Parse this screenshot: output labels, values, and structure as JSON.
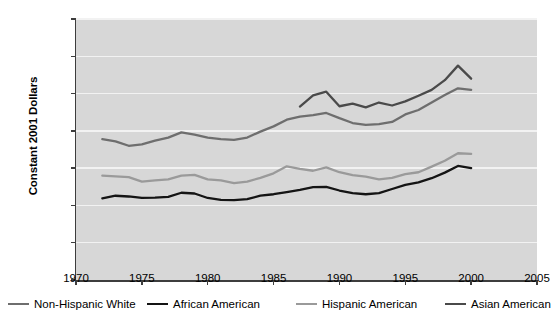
{
  "chart_data": {
    "type": "line",
    "title": "",
    "subtitle": "",
    "xlabel": "",
    "ylabel": "Constant 2001 Dollars",
    "xlim": [
      1970,
      2005
    ],
    "ylim": [
      0,
      70000
    ],
    "grid": true,
    "legend_position": "bottom",
    "y_ticks": [
      0,
      10000,
      20000,
      30000,
      40000,
      50000,
      60000,
      70000
    ],
    "y_tick_labels": [
      "0",
      "10,000",
      "20,000",
      "30,000",
      "40,000",
      "50,000",
      "60,000",
      "70,000"
    ],
    "x_ticks": [
      1970,
      1975,
      1980,
      1985,
      1990,
      1995,
      2000,
      2005
    ],
    "x_tick_labels": [
      "1970",
      "1975",
      "1980",
      "1985",
      "1990",
      "1995",
      "2000",
      "2005"
    ],
    "plot_background": "#d7d7d7",
    "gridline_color": "#f2f2f2",
    "axis_color": "#3d3d3d",
    "series": [
      {
        "name": "Non-Hispanic White",
        "color": "#6e6e6e",
        "x": [
          1972,
          1973,
          1974,
          1975,
          1976,
          1977,
          1978,
          1979,
          1980,
          1981,
          1982,
          1983,
          1984,
          1985,
          1986,
          1987,
          1988,
          1989,
          1990,
          1991,
          1992,
          1993,
          1994,
          1995,
          1996,
          1997,
          1998,
          1999,
          2000
        ],
        "values": [
          37800,
          37200,
          36000,
          36400,
          37400,
          38200,
          39600,
          39000,
          38200,
          37800,
          37600,
          38200,
          39800,
          41200,
          43000,
          43800,
          44200,
          44800,
          43400,
          42100,
          41600,
          41800,
          42400,
          44400,
          45600,
          47600,
          49600,
          51400,
          51000
        ]
      },
      {
        "name": "African American",
        "color": "#141414",
        "x": [
          1972,
          1973,
          1974,
          1975,
          1976,
          1977,
          1978,
          1979,
          1980,
          1981,
          1982,
          1983,
          1984,
          1985,
          1986,
          1987,
          1988,
          1989,
          1990,
          1991,
          1992,
          1993,
          1994,
          1995,
          1996,
          1997,
          1998,
          1999,
          2000
        ],
        "values": [
          21900,
          22600,
          22400,
          22000,
          22100,
          22300,
          23400,
          23200,
          22000,
          21500,
          21400,
          21700,
          22600,
          23000,
          23600,
          24200,
          24900,
          25000,
          24000,
          23300,
          23000,
          23300,
          24400,
          25500,
          26200,
          27300,
          28800,
          30600,
          30000
        ]
      },
      {
        "name": "Hispanic American",
        "color": "#9a9a9a",
        "x": [
          1972,
          1973,
          1974,
          1975,
          1976,
          1977,
          1978,
          1979,
          1980,
          1981,
          1982,
          1983,
          1984,
          1985,
          1986,
          1987,
          1988,
          1989,
          1990,
          1991,
          1992,
          1993,
          1994,
          1995,
          1996,
          1997,
          1998,
          1999,
          2000
        ],
        "values": [
          28000,
          27800,
          27600,
          26400,
          26700,
          27000,
          28000,
          28200,
          27000,
          26700,
          26000,
          26400,
          27400,
          28600,
          30500,
          29800,
          29300,
          30200,
          28900,
          28100,
          27700,
          27000,
          27400,
          28400,
          28900,
          30400,
          32000,
          34000,
          33800
        ]
      },
      {
        "name": "Asian American",
        "color": "#4a4a4a",
        "x": [
          1987,
          1988,
          1989,
          1990,
          1991,
          1992,
          1993,
          1994,
          1995,
          1996,
          1997,
          1998,
          1999,
          2000
        ],
        "values": [
          46500,
          49500,
          50500,
          46600,
          47300,
          46300,
          47600,
          46800,
          47900,
          49400,
          51000,
          53600,
          57500,
          54000
        ]
      }
    ]
  },
  "legend": {
    "items": [
      {
        "label": "Non-Hispanic White"
      },
      {
        "label": "African American"
      },
      {
        "label": "Hispanic American"
      },
      {
        "label": "Asian American"
      }
    ]
  }
}
